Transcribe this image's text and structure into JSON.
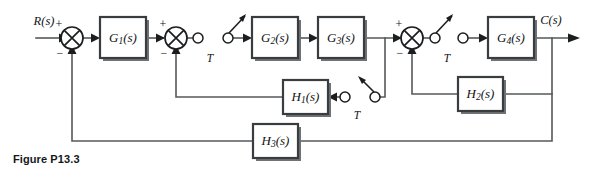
{
  "figure": {
    "caption": "Figure P13.3",
    "type": "control-system-block-diagram"
  },
  "signals": {
    "input": "R(s)",
    "output": "C(s)"
  },
  "blocks": [
    {
      "id": "G1",
      "label": "G",
      "sub": "1",
      "suffix": "(s)",
      "x": 100,
      "y": 17,
      "w": 46,
      "h": 41
    },
    {
      "id": "G2",
      "label": "G",
      "sub": "2",
      "suffix": "(s)",
      "x": 252,
      "y": 17,
      "w": 46,
      "h": 41
    },
    {
      "id": "G3",
      "label": "G",
      "sub": "3",
      "suffix": "(s)",
      "x": 318,
      "y": 17,
      "w": 46,
      "h": 41
    },
    {
      "id": "G4",
      "label": "G",
      "sub": "4",
      "suffix": "(s)",
      "x": 488,
      "y": 17,
      "w": 46,
      "h": 41
    },
    {
      "id": "H1",
      "label": "H",
      "sub": "1",
      "suffix": "(s)",
      "x": 283,
      "y": 80,
      "w": 45,
      "h": 34
    },
    {
      "id": "H2",
      "label": "H",
      "sub": "2",
      "suffix": "(s)",
      "x": 458,
      "y": 77,
      "w": 45,
      "h": 34
    },
    {
      "id": "H3",
      "label": "H",
      "sub": "3",
      "suffix": "(s)",
      "x": 253,
      "y": 124,
      "w": 45,
      "h": 34
    }
  ],
  "summing_junctions": [
    {
      "id": "sum1",
      "cx": 72,
      "cy": 38,
      "r": 11,
      "plus": "+",
      "minus": "−"
    },
    {
      "id": "sum2",
      "cx": 176,
      "cy": 38,
      "r": 11,
      "plus": "+",
      "minus": "−"
    },
    {
      "id": "sum3",
      "cx": 412,
      "cy": 38,
      "r": 11,
      "plus": "+",
      "minus": "−"
    }
  ],
  "samplers": [
    {
      "id": "sampler1",
      "label": "T",
      "cx_left": 198,
      "cx_right": 228,
      "cy": 38,
      "label_x": 210,
      "label_y": 59
    },
    {
      "id": "sampler2",
      "label": "T",
      "cx_left": 435,
      "cx_right": 463,
      "cy": 38,
      "label_x": 447,
      "label_y": 59
    },
    {
      "id": "sampler3",
      "label": "T",
      "cx_left": 345,
      "cx_right": 375,
      "cy": 97,
      "label_x": 357,
      "label_y": 116
    }
  ],
  "labels": {
    "input_x": 44,
    "input_y": 23,
    "output_x": 548,
    "output_y": 21,
    "T": "T"
  },
  "colors": {
    "wire": "#55585a",
    "block_stroke": "#3a3d3f",
    "text": "#111315",
    "background": "#ffffff"
  }
}
